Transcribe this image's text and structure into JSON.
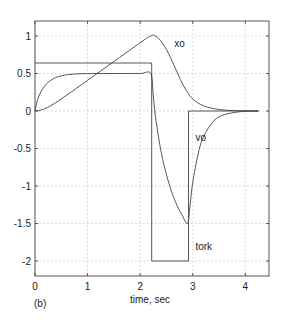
{
  "chart_data": {
    "type": "line",
    "title": "",
    "panel_label": "(b)",
    "xlabel": "time, sec",
    "ylabel": "",
    "xlim": [
      0,
      4.45
    ],
    "ylim": [
      -2.2,
      1.2
    ],
    "grid": true,
    "xticks": [
      0,
      1,
      2,
      3,
      4
    ],
    "xtick_labels": [
      "0",
      "1",
      "2",
      "3",
      "4"
    ],
    "yticks": [
      1,
      0.5,
      0,
      -0.5,
      -1,
      -1.5,
      -2
    ],
    "ytick_labels": [
      "1",
      "0.5",
      "0",
      "-0.5",
      "-1",
      "-1.5",
      "-2"
    ],
    "series": [
      {
        "name": "xo",
        "label_at": [
          2.65,
          0.85
        ],
        "x": [
          0,
          0.1,
          0.3,
          0.6,
          1.0,
          1.4,
          1.8,
          2.1,
          2.2,
          2.25,
          2.35,
          2.5,
          2.65,
          2.8,
          2.9,
          3.0,
          3.2,
          3.5,
          3.8,
          4.1,
          4.25
        ],
        "y": [
          0,
          0.01,
          0.07,
          0.21,
          0.41,
          0.61,
          0.81,
          0.96,
          1.0,
          1.01,
          0.97,
          0.82,
          0.6,
          0.37,
          0.25,
          0.16,
          0.07,
          0.02,
          0.005,
          0.001,
          0
        ]
      },
      {
        "name": "vo",
        "label_at": [
          3.05,
          -0.4
        ],
        "x": [
          0,
          0.05,
          0.15,
          0.3,
          0.5,
          0.8,
          1.2,
          1.6,
          2.0,
          2.2,
          2.25,
          2.3,
          2.4,
          2.5,
          2.6,
          2.7,
          2.8,
          2.9,
          2.95,
          3.0,
          3.1,
          3.2,
          3.4,
          3.6,
          3.9,
          4.25
        ],
        "y": [
          0,
          0.15,
          0.3,
          0.41,
          0.47,
          0.495,
          0.5,
          0.5,
          0.5,
          0.5,
          0.2,
          -0.12,
          -0.55,
          -0.85,
          -1.08,
          -1.26,
          -1.39,
          -1.5,
          -1.25,
          -0.95,
          -0.58,
          -0.35,
          -0.13,
          -0.05,
          -0.01,
          0
        ]
      },
      {
        "name": "tork",
        "label_at": [
          3.05,
          -1.85
        ],
        "x": [
          0,
          2.22,
          2.22,
          2.92,
          2.92,
          4.25
        ],
        "y": [
          0.64,
          0.64,
          -2,
          -2,
          0,
          0
        ]
      }
    ]
  }
}
